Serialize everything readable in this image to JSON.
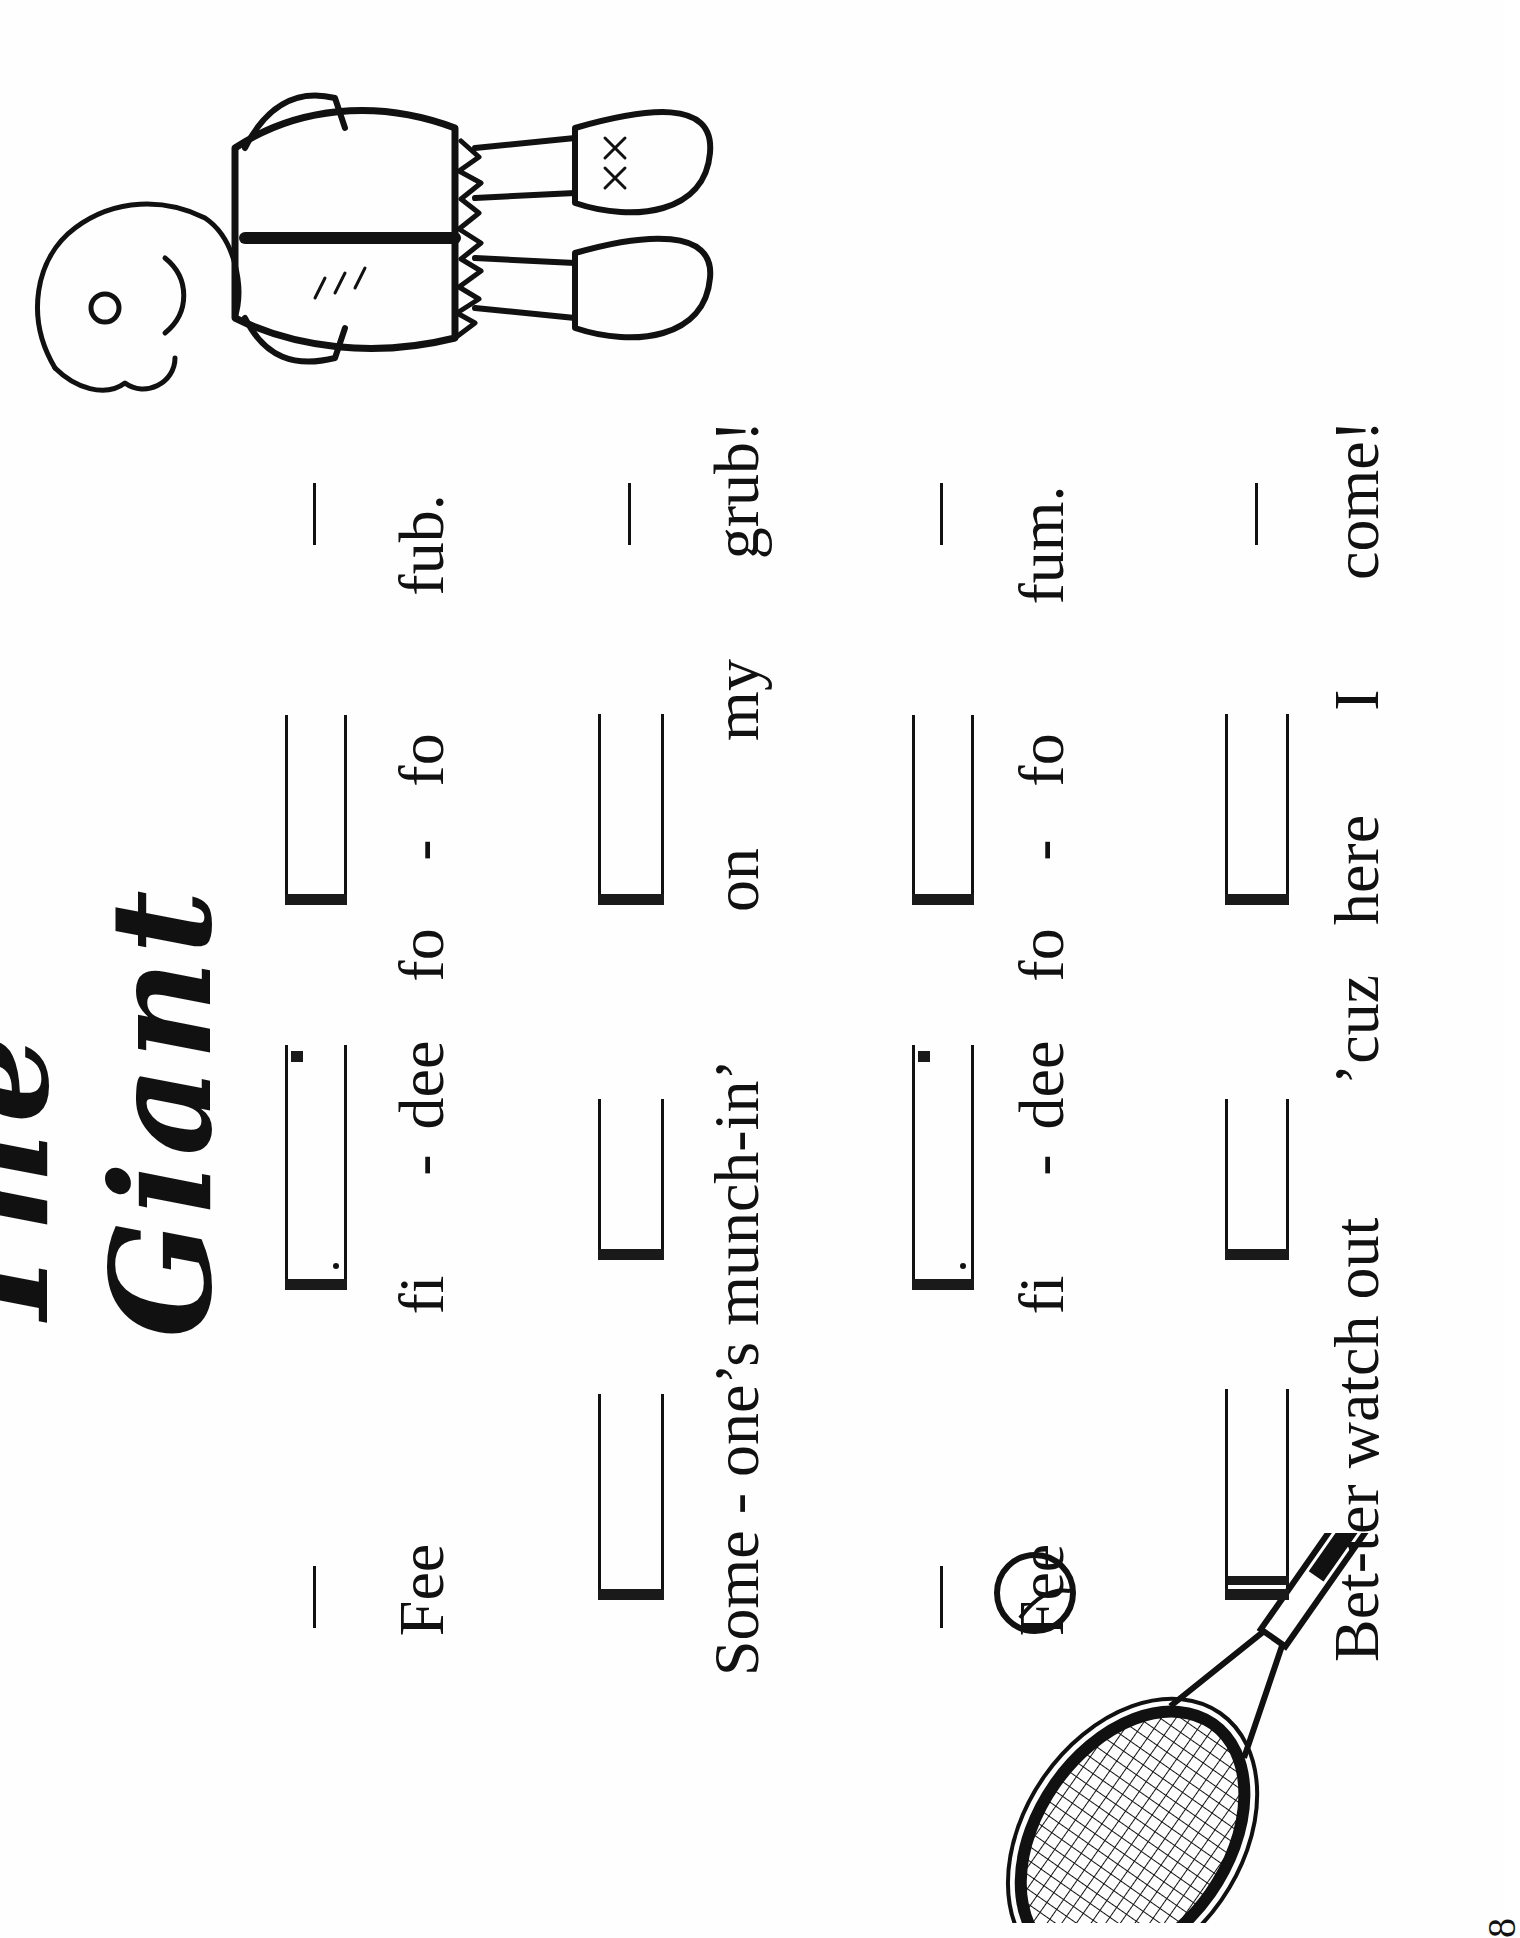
{
  "page": {
    "orientation": "rotated-90-ccw",
    "title": "The Giant",
    "page_number": "8"
  },
  "rows": [
    {
      "rhythm": [
        "rest-bar",
        "dotted-eighth-sixteenth",
        "eighth-pair",
        "rest-bar"
      ],
      "words": [
        "Fee",
        "fi",
        "-",
        "dee",
        "fo",
        "-",
        "fo",
        "fub."
      ]
    },
    {
      "rhythm": [
        "eighth-pair",
        "eighth-pair",
        "eighth-pair",
        "rest-bar"
      ],
      "words": [
        "Some - one’s munch-in’",
        "on",
        "my",
        "grub!"
      ]
    },
    {
      "rhythm": [
        "rest-bar",
        "dotted-eighth-sixteenth",
        "eighth-pair",
        "rest-bar"
      ],
      "words": [
        "Fee",
        "fi",
        "-",
        "dee",
        "fo",
        "-",
        "fo",
        "fum."
      ]
    },
    {
      "rhythm": [
        "sixteenth-group",
        "eighth-pair",
        "eighth-pair",
        "rest-bar"
      ],
      "words": [
        "Bet-ter watch out",
        "’cuz",
        "here",
        "I",
        "come!"
      ]
    }
  ],
  "illustrations": {
    "giant": "giant-character-drawing",
    "racket": "tennis-racket-and-ball-drawing"
  },
  "colors": {
    "ink": "#111111",
    "paper": "#fefefe"
  }
}
